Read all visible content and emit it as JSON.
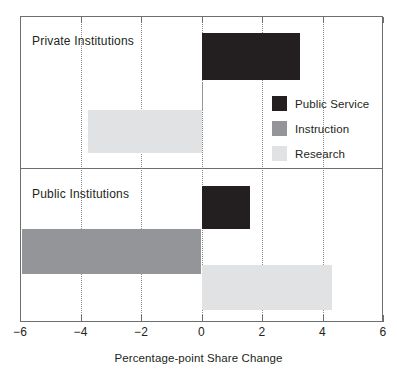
{
  "chart_data": {
    "type": "bar",
    "orientation": "horizontal",
    "title": "",
    "xlabel": "Percentage-point Share Change",
    "ylabel": "",
    "xlim": [
      -6,
      6
    ],
    "xticks": [
      -6,
      -4,
      -2,
      0,
      2,
      4,
      6
    ],
    "xtick_labels": [
      "−6",
      "−4",
      "−2",
      "0",
      "2",
      "4",
      "6"
    ],
    "gridlines": [
      -4,
      -2,
      0,
      2,
      4
    ],
    "grid": true,
    "grid_style": "dotted",
    "legend_position": "upper right (inside top panel)",
    "panels": [
      {
        "label": "Private Institutions",
        "values": [
          {
            "series": "Public Service",
            "value": 3.25
          },
          {
            "series": "Instruction",
            "value": 0.05
          },
          {
            "series": "Research",
            "value": -3.75
          }
        ]
      },
      {
        "label": "Public Institutions",
        "values": [
          {
            "series": "Public Service",
            "value": 1.6
          },
          {
            "series": "Instruction",
            "value": -5.95
          },
          {
            "series": "Research",
            "value": 4.3
          }
        ]
      }
    ],
    "series": [
      {
        "name": "Public Service",
        "color": "#231f20",
        "values": [
          3.25,
          1.6
        ]
      },
      {
        "name": "Instruction",
        "color": "#939598",
        "values": [
          0.05,
          -5.95
        ]
      },
      {
        "name": "Research",
        "color": "#e1e2e3",
        "values": [
          -3.75,
          4.3
        ]
      }
    ],
    "categories": [
      "Private Institutions",
      "Public Institutions"
    ]
  },
  "legend": {
    "items": [
      {
        "label": "Public Service",
        "color": "#231f20"
      },
      {
        "label": "Instruction",
        "color": "#939598"
      },
      {
        "label": "Research",
        "color": "#e1e2e3"
      }
    ]
  },
  "axis": {
    "title": "Percentage-point Share Change",
    "ticks": [
      {
        "label": "−6",
        "value": -6
      },
      {
        "label": "−4",
        "value": -4
      },
      {
        "label": "−2",
        "value": -2
      },
      {
        "label": "0",
        "value": 0
      },
      {
        "label": "2",
        "value": 2
      },
      {
        "label": "4",
        "value": 4
      },
      {
        "label": "6",
        "value": 6
      }
    ]
  },
  "panels": {
    "private": {
      "label": "Private Institutions"
    },
    "public": {
      "label": "Public Institutions"
    }
  }
}
